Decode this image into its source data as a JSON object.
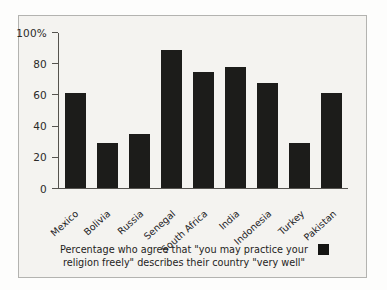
{
  "chart_data": {
    "type": "bar",
    "title": "",
    "subtitle": "",
    "xlabel": "",
    "ylabel": "",
    "categories": [
      "Mexico",
      "Bolivia",
      "Russia",
      "Senegal",
      "South Africa",
      "India",
      "Indonesia",
      "Turkey",
      "Pakistan"
    ],
    "values": [
      61,
      29,
      35,
      89,
      75,
      78,
      68,
      29,
      61
    ],
    "ylim": [
      0,
      100
    ],
    "yticks": [
      0,
      20,
      40,
      60,
      80,
      100
    ],
    "ytick_labels": [
      "0",
      "20",
      "40",
      "60",
      "80",
      "100%"
    ],
    "grid": false,
    "legend_position": "bottom",
    "legend": [
      {
        "label": "Percentage who agree that \"you may practice your religion freely\" describes their country \"very well\"",
        "color": "#151513"
      }
    ],
    "bar_color": "#1c1c1a",
    "background_color": "#f4f3f0",
    "axis_color": "#55534f",
    "border_color": "#b3b3b0"
  },
  "caption": {
    "line1": "Percentage who agree that \"you may practice your",
    "line2": "religion freely\" describes their country \"very well\""
  }
}
